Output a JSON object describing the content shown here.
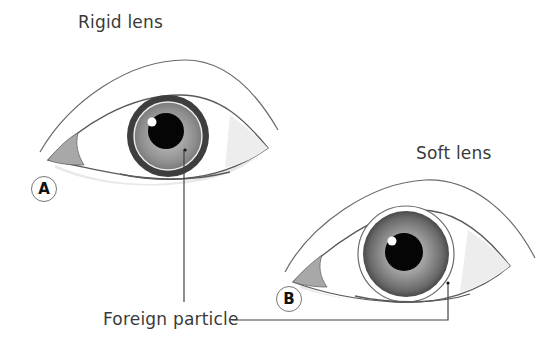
{
  "diagram": {
    "panels": [
      {
        "id": "A",
        "title": "Rigid lens",
        "badge": "A"
      },
      {
        "id": "B",
        "title": "Soft lens",
        "badge": "B"
      }
    ],
    "callout": {
      "label": "Foreign particle"
    },
    "colors": {
      "outline": "#5a5a5a",
      "iris_dark": "#3b3b3b",
      "iris_mid": "#8a8a8a",
      "pupil": "#000000",
      "lens_ring": "#e8e8e8",
      "caruncle": "#a8a8a8",
      "text": "#3a3a3a"
    }
  }
}
